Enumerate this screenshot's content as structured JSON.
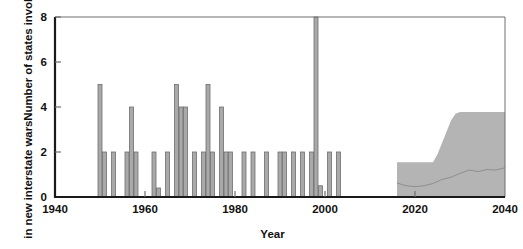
{
  "chart_data": {
    "type": "bar",
    "title": "",
    "xlabel": "Year",
    "ylabel": "Number of states involved in new interstate wars",
    "ylabel_lines": [
      "Number of states involved",
      "in new interstate wars"
    ],
    "xlim": [
      1940,
      2040
    ],
    "ylim": [
      0,
      8
    ],
    "xticks": [
      1940,
      1960,
      1980,
      2000,
      2020,
      2040
    ],
    "xtick_labels": [
      "1940",
      "1960",
      "1980",
      "2000",
      "2020",
      "2040"
    ],
    "yticks": [
      0,
      2,
      4,
      6,
      8
    ],
    "ytick_labels": [
      "0",
      "2",
      "4",
      "6",
      "8"
    ],
    "grid": false,
    "legend": "none",
    "bar_color": "#a9a9a9",
    "bar_edge_color": "#6e6e6e",
    "band_color": "#b4b4b4",
    "median_color": "#8a8a8a",
    "axis_color": "#1a1a1a",
    "frame_color": "#6e6e6e",
    "series": [
      {
        "name": "States involved in new interstate wars",
        "kind": "bars",
        "x": [
          1950,
          1951,
          1953,
          1956,
          1957,
          1958,
          1962,
          1963,
          1965,
          1967,
          1968,
          1969,
          1971,
          1973,
          1974,
          1975,
          1977,
          1978,
          1979,
          1982,
          1984,
          1987,
          1990,
          1991,
          1993,
          1995,
          1997,
          1998,
          1999,
          2001,
          2003
        ],
        "values": [
          5,
          2,
          2,
          2,
          4,
          2,
          2,
          0.4,
          2,
          5,
          4,
          4,
          2,
          2,
          5,
          2,
          4,
          2,
          2,
          2,
          2,
          2,
          2,
          2,
          2,
          2,
          2,
          8,
          0.5,
          2,
          2
        ]
      },
      {
        "name": "Projected range (uncertainty band)",
        "kind": "band",
        "x": [
          2016,
          2017,
          2024,
          2025,
          2026,
          2027,
          2028,
          2029,
          2030,
          2040
        ],
        "lower": [
          0,
          0,
          0,
          0,
          0,
          0,
          0,
          0,
          0,
          0
        ],
        "upper": [
          1.55,
          1.55,
          1.55,
          1.9,
          2.4,
          2.9,
          3.4,
          3.7,
          3.78,
          3.78
        ]
      },
      {
        "name": "Projected median",
        "kind": "line",
        "x": [
          2016,
          2018,
          2020,
          2022,
          2024,
          2026,
          2028,
          2030,
          2032,
          2034,
          2036,
          2038,
          2040
        ],
        "values": [
          0.62,
          0.5,
          0.46,
          0.5,
          0.6,
          0.78,
          0.88,
          1.05,
          1.2,
          1.13,
          1.22,
          1.2,
          1.3
        ]
      }
    ],
    "annotations": []
  },
  "figure": {
    "plot_area": {
      "x0": 55,
      "y0": 17,
      "x1": 505,
      "y1": 197
    }
  }
}
